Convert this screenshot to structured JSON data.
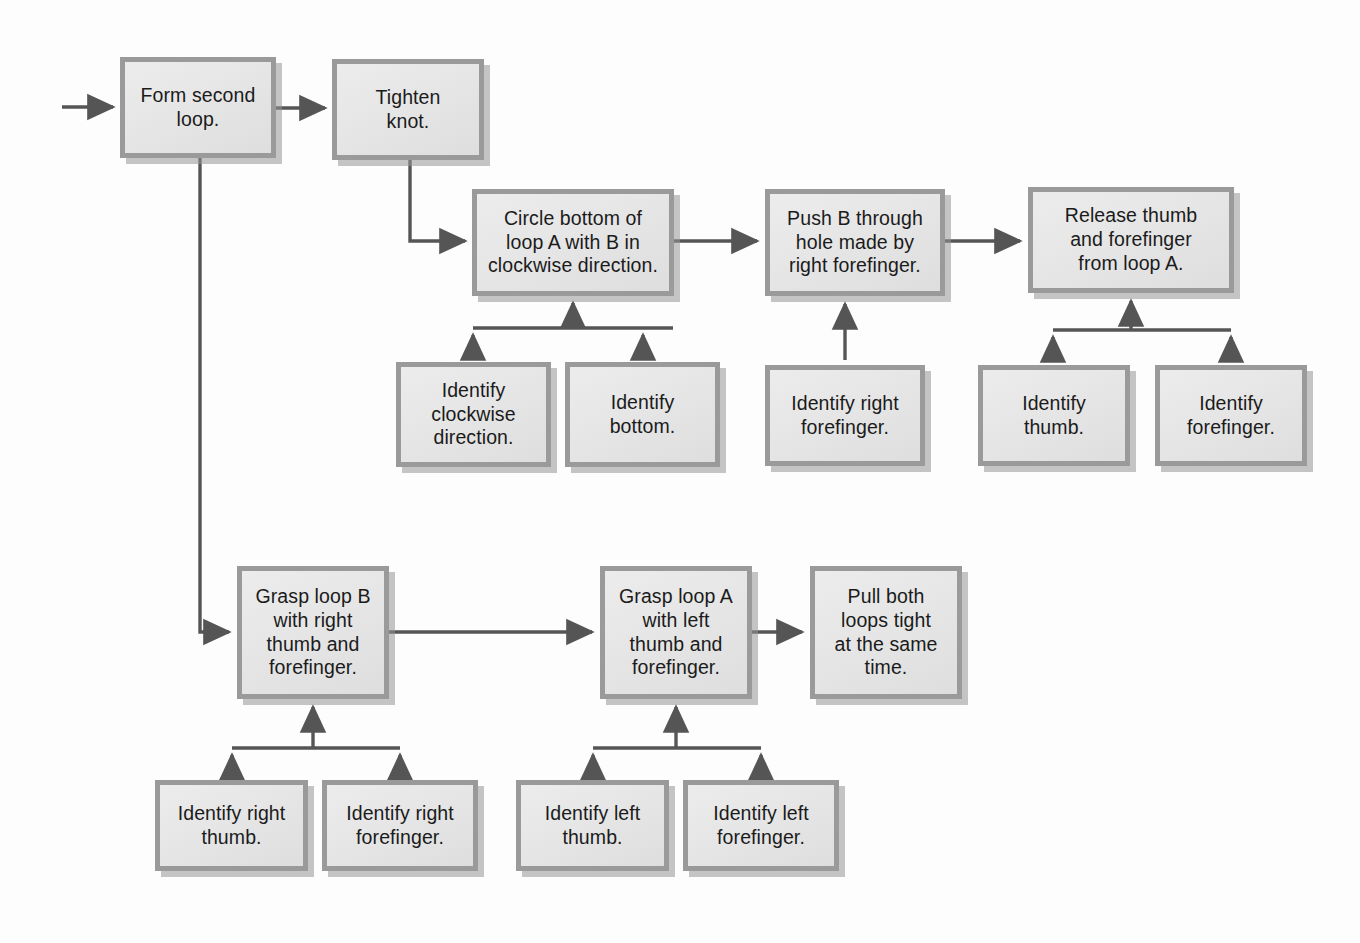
{
  "diagram": {
    "type": "flowchart",
    "colors": {
      "box_fill": "#e8e8e8",
      "box_border": "#9a9a9a",
      "shadow": "#969696",
      "connector": "#555555",
      "text": "#1b1b1b",
      "background": "#ffffff"
    },
    "nodes": [
      {
        "id": "form-second-loop",
        "text": "Form second\nloop.",
        "x": 120,
        "y": 57,
        "w": 156,
        "h": 101,
        "level": "main"
      },
      {
        "id": "tighten-knot",
        "text": "Tighten\nknot.",
        "x": 332,
        "y": 59,
        "w": 152,
        "h": 101,
        "level": "main"
      },
      {
        "id": "circle-bottom-loop-a",
        "text": "Circle bottom of\nloop A with B in\nclockwise direction.",
        "x": 472,
        "y": 189,
        "w": 202,
        "h": 107,
        "level": "main"
      },
      {
        "id": "push-b-through-hole",
        "text": "Push B through\nhole made by\nright forefinger.",
        "x": 765,
        "y": 189,
        "w": 180,
        "h": 107,
        "level": "main"
      },
      {
        "id": "release-thumb-forefinger",
        "text": "Release thumb\nand forefinger\nfrom loop A.",
        "x": 1028,
        "y": 187,
        "w": 206,
        "h": 106,
        "level": "main"
      },
      {
        "id": "identify-clockwise-direction",
        "text": "Identify\nclockwise\ndirection.",
        "x": 396,
        "y": 362,
        "w": 155,
        "h": 105,
        "level": "sub"
      },
      {
        "id": "identify-bottom",
        "text": "Identify\nbottom.",
        "x": 565,
        "y": 362,
        "w": 155,
        "h": 105,
        "level": "sub"
      },
      {
        "id": "identify-right-forefinger-push",
        "text": "Identify right\nforefinger.",
        "x": 765,
        "y": 365,
        "w": 160,
        "h": 101,
        "level": "sub"
      },
      {
        "id": "identify-thumb",
        "text": "Identify\nthumb.",
        "x": 978,
        "y": 365,
        "w": 152,
        "h": 101,
        "level": "sub"
      },
      {
        "id": "identify-forefinger",
        "text": "Identify\nforefinger.",
        "x": 1155,
        "y": 365,
        "w": 152,
        "h": 101,
        "level": "sub"
      },
      {
        "id": "grasp-loop-b",
        "text": "Grasp loop B\nwith right\nthumb and\nforefinger.",
        "x": 237,
        "y": 566,
        "w": 152,
        "h": 133,
        "level": "main"
      },
      {
        "id": "grasp-loop-a",
        "text": "Grasp loop A\nwith left\nthumb and\nforefinger.",
        "x": 600,
        "y": 566,
        "w": 152,
        "h": 133,
        "level": "main"
      },
      {
        "id": "pull-both-loops-tight",
        "text": "Pull both\nloops tight\nat the same\ntime.",
        "x": 810,
        "y": 566,
        "w": 152,
        "h": 133,
        "level": "main"
      },
      {
        "id": "identify-right-thumb",
        "text": "Identify right\nthumb.",
        "x": 155,
        "y": 780,
        "w": 153,
        "h": 91,
        "level": "sub"
      },
      {
        "id": "identify-right-forefinger",
        "text": "Identify right\nforefinger.",
        "x": 322,
        "y": 780,
        "w": 156,
        "h": 91,
        "level": "sub"
      },
      {
        "id": "identify-left-thumb",
        "text": "Identify left\nthumb.",
        "x": 516,
        "y": 780,
        "w": 153,
        "h": 91,
        "level": "sub"
      },
      {
        "id": "identify-left-forefinger",
        "text": "Identify left\nforefinger.",
        "x": 683,
        "y": 780,
        "w": 156,
        "h": 91,
        "level": "sub"
      }
    ],
    "connectors": [
      {
        "id": "entry-to-form-second-loop",
        "kind": "arrow-right"
      },
      {
        "id": "form-second-loop-to-tighten-knot",
        "kind": "arrow-right"
      },
      {
        "id": "tighten-knot-to-circle-bottom",
        "kind": "elbow-down-right"
      },
      {
        "id": "circle-bottom-to-push-b",
        "kind": "arrow-right"
      },
      {
        "id": "push-b-to-release-thumb",
        "kind": "arrow-right"
      },
      {
        "id": "form-second-loop-to-grasp-loop-b",
        "kind": "elbow-down-right"
      },
      {
        "id": "grasp-loop-b-to-grasp-loop-a",
        "kind": "arrow-right"
      },
      {
        "id": "grasp-loop-a-to-pull-both",
        "kind": "arrow-right"
      },
      {
        "id": "bracket-circle-bottom",
        "kind": "bracket-up"
      },
      {
        "id": "bracket-push-b",
        "kind": "arrow-up"
      },
      {
        "id": "bracket-release-thumb",
        "kind": "bracket-up"
      },
      {
        "id": "bracket-grasp-loop-b",
        "kind": "bracket-up"
      },
      {
        "id": "bracket-grasp-loop-a",
        "kind": "bracket-up"
      }
    ]
  }
}
